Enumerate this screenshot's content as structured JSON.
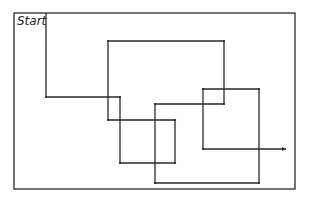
{
  "diagram": {
    "start_label": "Start",
    "stroke_color": "#2a2a2a",
    "background": "#ffffff",
    "frame": {
      "x": 14,
      "y": 13,
      "width": 281,
      "height": 176
    },
    "path_points": [
      [
        46,
        13
      ],
      [
        46,
        97
      ],
      [
        120,
        97
      ],
      [
        120,
        163
      ],
      [
        175,
        163
      ],
      [
        175,
        120
      ],
      [
        108,
        120
      ],
      [
        108,
        41
      ],
      [
        224,
        41
      ],
      [
        224,
        104
      ],
      [
        155,
        104
      ],
      [
        155,
        183
      ],
      [
        259,
        183
      ],
      [
        259,
        89
      ],
      [
        203,
        89
      ],
      [
        203,
        149
      ],
      [
        286,
        149
      ]
    ]
  }
}
